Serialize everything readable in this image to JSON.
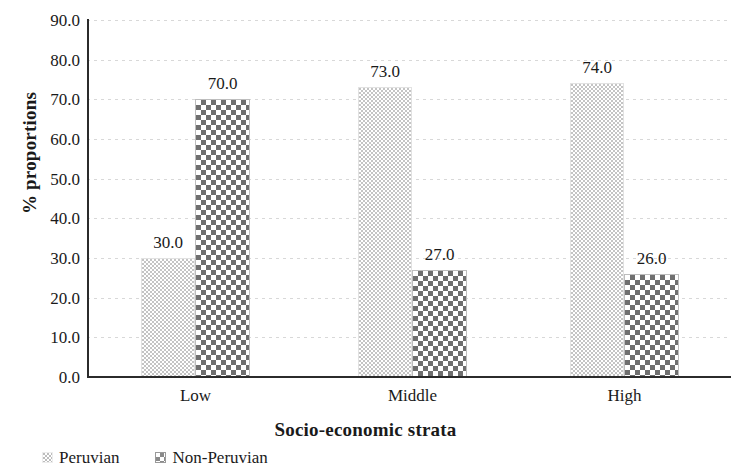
{
  "chart_data": {
    "type": "bar",
    "title": "",
    "subtitle": "",
    "xlabel": "Socio-economic strata",
    "ylabel": "% proportions",
    "categories": [
      "Low",
      "Middle",
      "High"
    ],
    "series": [
      {
        "name": "Peruvian",
        "values": [
          30.0,
          70.0,
          0
        ],
        "pattern": "fine-dotted"
      },
      {
        "name": "Non-Peruvian",
        "values": [
          70.0,
          27.0,
          26.0
        ],
        "pattern": "checkerboard"
      }
    ],
    "series_corrected": [
      {
        "name": "Peruvian",
        "values": [
          30.0,
          73.0,
          74.0
        ]
      },
      {
        "name": "Non-Peruvian",
        "values": [
          70.0,
          27.0,
          26.0
        ]
      }
    ],
    "data_labels": [
      {
        "group": "Low",
        "series": "Peruvian",
        "text": "30.0",
        "value": 30.0
      },
      {
        "group": "Low",
        "series": "Non-Peruvian",
        "text": "70.0",
        "value": 70.0
      },
      {
        "group": "Middle",
        "series": "Peruvian",
        "text": "73.0",
        "value": 73.0
      },
      {
        "group": "Middle",
        "series": "Non-Peruvian",
        "text": "27.0",
        "value": 27.0
      },
      {
        "group": "High",
        "series": "Peruvian",
        "text": "74.0",
        "value": 74.0
      },
      {
        "group": "High",
        "series": "Non-Peruvian",
        "text": "26.0",
        "value": 26.0
      }
    ],
    "ylim": [
      0.0,
      90.0
    ],
    "ytick_step": 10.0,
    "ytick_labels": [
      "0.0",
      "10.0",
      "20.0",
      "30.0",
      "40.0",
      "50.0",
      "60.0",
      "70.0",
      "80.0",
      "90.0"
    ],
    "grid": true,
    "grid_axis": "y",
    "grid_style": "dotted-light",
    "legend_position": "bottom-left",
    "colors": {
      "axis": "#2b2b2b",
      "gridline": "#d8d8d8",
      "text": "#1a1a1a",
      "peruvian_fill": "#c4c4c4",
      "non_peruvian_fill": "#6f6f6f",
      "background": "#ffffff"
    }
  },
  "axes": {
    "y_title": "% proportions",
    "x_title": "Socio-economic strata",
    "y_ticks": [
      {
        "label": "90.0",
        "value": 90.0
      },
      {
        "label": "80.0",
        "value": 80.0
      },
      {
        "label": "70.0",
        "value": 70.0
      },
      {
        "label": "60.0",
        "value": 60.0
      },
      {
        "label": "50.0",
        "value": 50.0
      },
      {
        "label": "40.0",
        "value": 40.0
      },
      {
        "label": "30.0",
        "value": 30.0
      },
      {
        "label": "20.0",
        "value": 20.0
      },
      {
        "label": "10.0",
        "value": 10.0
      },
      {
        "label": "0.0",
        "value": 0.0
      }
    ],
    "x_categories": [
      {
        "label": "Low"
      },
      {
        "label": "Middle"
      },
      {
        "label": "High"
      }
    ]
  },
  "legend": {
    "items": [
      {
        "label": "Peruvian",
        "pattern": "fine-dotted"
      },
      {
        "label": "Non-Peruvian",
        "pattern": "checkerboard"
      }
    ]
  },
  "bars": [
    {
      "group": "Low",
      "series": "Peruvian",
      "value": 30.0,
      "label": "30.0",
      "x": 141,
      "width": 54,
      "pattern": "fine-dotted"
    },
    {
      "group": "Low",
      "series": "Non-Peruvian",
      "value": 70.0,
      "label": "70.0",
      "x": 195,
      "width": 55,
      "pattern": "checkerboard"
    },
    {
      "group": "Middle",
      "series": "Peruvian",
      "value": 73.0,
      "label": "73.0",
      "x": 358,
      "width": 54,
      "pattern": "fine-dotted"
    },
    {
      "group": "Middle",
      "series": "Non-Peruvian",
      "value": 27.0,
      "label": "27.0",
      "x": 412,
      "width": 55,
      "pattern": "checkerboard"
    },
    {
      "group": "High",
      "series": "Peruvian",
      "value": 74.0,
      "label": "74.0",
      "x": 570,
      "width": 54,
      "pattern": "fine-dotted"
    },
    {
      "group": "High",
      "series": "Non-Peruvian",
      "value": 26.0,
      "label": "26.0",
      "x": 624,
      "width": 55,
      "pattern": "checkerboard"
    }
  ]
}
